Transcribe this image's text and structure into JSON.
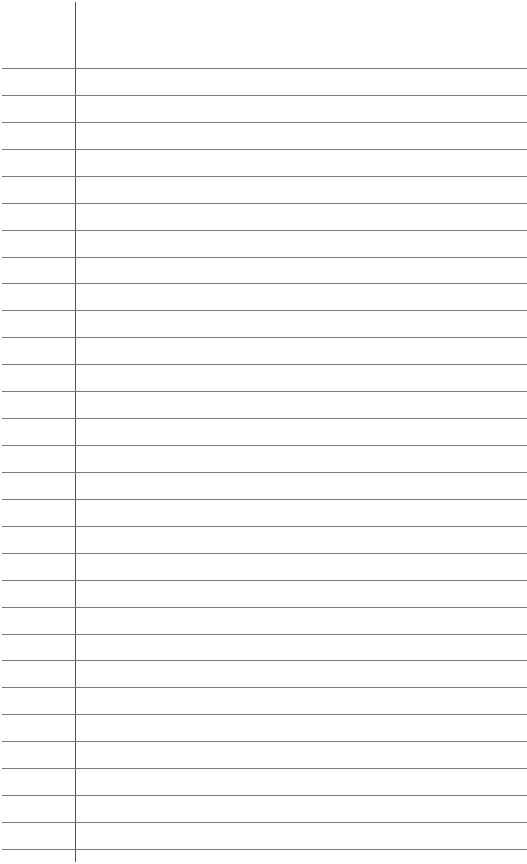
{
  "page": {
    "kind": "lined-notebook-paper",
    "ruled_line_count": 30,
    "has_margin_line": true,
    "text_content": "",
    "colors": {
      "paper": "#ffffff",
      "ruled_line": "#7a7a7a",
      "margin_line": "#555555"
    }
  }
}
